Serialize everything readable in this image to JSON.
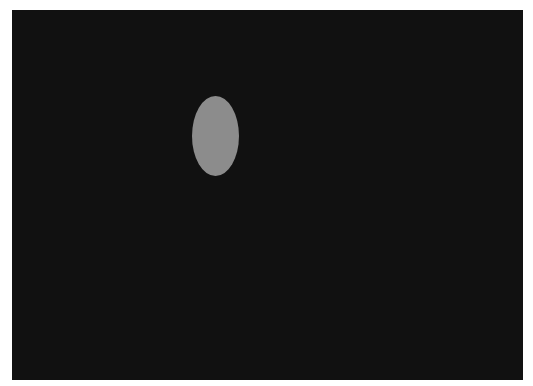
{
  "display": {
    "background_color": "#ffffff",
    "canvas": {
      "x": 12,
      "y": 10,
      "width": 511,
      "height": 370,
      "color": "#111111"
    },
    "stimulus": {
      "shape": "ellipse",
      "center_x": 215,
      "center_y": 136,
      "radius_x": 23.5,
      "radius_y": 40,
      "color": "#8c8c8c"
    }
  }
}
